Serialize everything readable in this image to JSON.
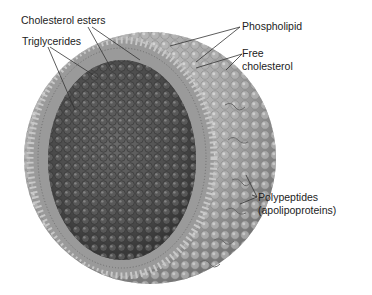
{
  "diagram": {
    "labels": {
      "cholesterol_esters": "Cholesterol esters",
      "triglycerides": "Triglycerides",
      "phospholipid": "Phospholipid",
      "free_cholesterol_line1": "Free",
      "free_cholesterol_line2": "cholesterol",
      "polypeptides_line1": "Polypeptides",
      "polypeptides_line2": "(apolipoproteins)"
    },
    "colors": {
      "core": "#4a4a4a",
      "shell": "#a8a8a8",
      "shell_highlight": "#d6d6d6",
      "leader_line": "#333333"
    }
  }
}
